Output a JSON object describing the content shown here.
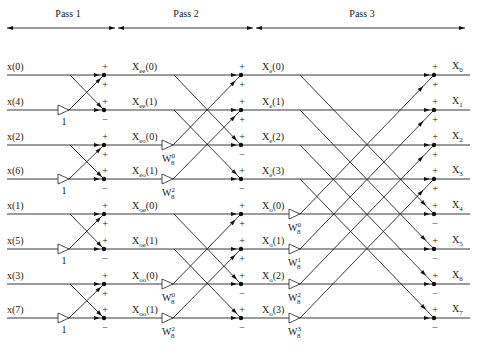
{
  "passes": [
    {
      "label": "Pass 1",
      "x_start": 7,
      "x_end": 115,
      "label_x": 68
    },
    {
      "label": "Pass 2",
      "x_start": 118,
      "x_end": 253,
      "label_x": 186
    },
    {
      "label": "Pass 3",
      "x_start": 256,
      "x_end": 465,
      "label_x": 362
    }
  ],
  "rows_y": [
    75,
    110,
    145,
    179,
    214,
    249,
    284,
    318
  ],
  "inputs": [
    "x(0)",
    "x(4)",
    "x(2)",
    "x(6)",
    "x(1)",
    "x(5)",
    "x(3)",
    "x(7)"
  ],
  "stage1_outputs": [
    {
      "base": "X",
      "sub": "ee",
      "arg": "(0)"
    },
    {
      "base": "X",
      "sub": "ee",
      "arg": "(1)"
    },
    {
      "base": "X",
      "sub": "eo",
      "arg": "(0)"
    },
    {
      "base": "X",
      "sub": "eo",
      "arg": "(1)"
    },
    {
      "base": "X",
      "sub": "oe",
      "arg": "(0)"
    },
    {
      "base": "X",
      "sub": "oe",
      "arg": "(1)"
    },
    {
      "base": "X",
      "sub": "oo",
      "arg": "(0)"
    },
    {
      "base": "X",
      "sub": "oo",
      "arg": "(1)"
    }
  ],
  "stage2_outputs": [
    {
      "base": "X",
      "sub": "e",
      "arg": "(0)"
    },
    {
      "base": "X",
      "sub": "e",
      "arg": "(1)"
    },
    {
      "base": "X",
      "sub": "e",
      "arg": "(2)"
    },
    {
      "base": "X",
      "sub": "e",
      "arg": "(3)"
    },
    {
      "base": "X",
      "sub": "o",
      "arg": "(0)"
    },
    {
      "base": "X",
      "sub": "o",
      "arg": "(1)"
    },
    {
      "base": "X",
      "sub": "o",
      "arg": "(2)"
    },
    {
      "base": "X",
      "sub": "o",
      "arg": "(3)"
    }
  ],
  "outputs": [
    {
      "base": "X",
      "sub": "0"
    },
    {
      "base": "X",
      "sub": "1"
    },
    {
      "base": "X",
      "sub": "2"
    },
    {
      "base": "X",
      "sub": "3"
    },
    {
      "base": "X",
      "sub": "4"
    },
    {
      "base": "X",
      "sub": "5"
    },
    {
      "base": "X",
      "sub": "6"
    },
    {
      "base": "X",
      "sub": "7"
    }
  ],
  "stage1_twiddles": [
    {
      "row": 1,
      "label": "1"
    },
    {
      "row": 3,
      "label": "1"
    },
    {
      "row": 5,
      "label": "1"
    },
    {
      "row": 7,
      "label": "1"
    }
  ],
  "stage2_twiddles": [
    {
      "row": 2,
      "base": "W",
      "sub": "8",
      "sup": "0"
    },
    {
      "row": 3,
      "base": "W",
      "sub": "8",
      "sup": "2"
    },
    {
      "row": 6,
      "base": "W",
      "sub": "8",
      "sup": "0"
    },
    {
      "row": 7,
      "base": "W",
      "sub": "8",
      "sup": "2"
    }
  ],
  "stage3_twiddles": [
    {
      "row": 4,
      "base": "W",
      "sub": "8",
      "sup": "0"
    },
    {
      "row": 5,
      "base": "W",
      "sub": "8",
      "sup": "1"
    },
    {
      "row": 6,
      "base": "W",
      "sub": "8",
      "sup": "2"
    },
    {
      "row": 7,
      "base": "W",
      "sub": "8",
      "sup": "3"
    }
  ],
  "signs": {
    "plus": "+",
    "minus": "−"
  },
  "colors": {
    "ink": "#1a1a1a",
    "background": "#ffffff"
  }
}
